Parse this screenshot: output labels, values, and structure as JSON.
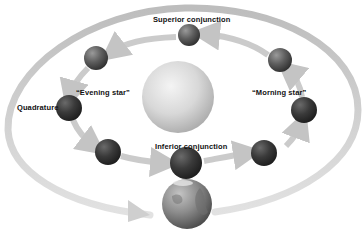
{
  "diagram": {
    "type": "orbital-phases",
    "labels": {
      "superior_conjunction": "Superior conjunction",
      "evening_star": "“Evening star”",
      "morning_star": "“Morning star”",
      "quadrature": "Quadrature",
      "inferior_conjunction": "Inferior conjunction"
    },
    "bodies": [
      {
        "id": "sun",
        "kind": "sun"
      },
      {
        "id": "earth",
        "kind": "earth"
      },
      {
        "id": "planet-superior-conjunction",
        "kind": "inner-planet"
      },
      {
        "id": "planet-upper-left",
        "kind": "inner-planet"
      },
      {
        "id": "planet-quadrature",
        "kind": "inner-planet"
      },
      {
        "id": "planet-lower-left",
        "kind": "inner-planet"
      },
      {
        "id": "planet-inferior-conjunction",
        "kind": "inner-planet"
      },
      {
        "id": "planet-lower-right",
        "kind": "inner-planet"
      },
      {
        "id": "planet-morning-star",
        "kind": "inner-planet"
      },
      {
        "id": "planet-upper-right",
        "kind": "inner-planet"
      }
    ],
    "colors": {
      "background": "#ffffff",
      "orbit_band": "#c8c8c8",
      "sun": "#d6d6d6",
      "planet": "#555555",
      "earth": "#8a8a8a",
      "text": "#111111"
    }
  }
}
